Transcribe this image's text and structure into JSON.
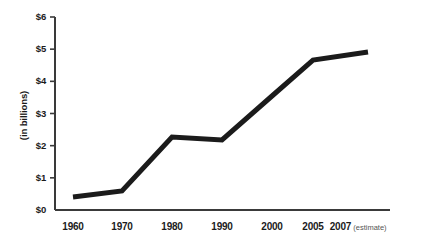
{
  "chart_data": {
    "type": "line",
    "title": "",
    "subtitle": "",
    "xlabel": "",
    "ylabel": "(in billions)",
    "ylim": [
      0,
      6
    ],
    "y_ticks": [
      0,
      1,
      2,
      3,
      4,
      5,
      6
    ],
    "y_tick_labels": [
      "$0",
      "$1",
      "$2",
      "$3",
      "$4",
      "$5",
      "$6"
    ],
    "categories": [
      "1960",
      "1970",
      "1980",
      "1990",
      "2000",
      "2005",
      "2007"
    ],
    "x_tick_labels": [
      "1960",
      "1970",
      "1980",
      "1990",
      "2000",
      "2005",
      "2007"
    ],
    "values": [
      0.5,
      0.8,
      2.3,
      2.25,
      3.55,
      4.65,
      4.9
    ],
    "annotations": [
      {
        "text": "(estimate)",
        "attached_to": "2007"
      }
    ],
    "grid": false,
    "legend": null,
    "series": [
      {
        "name": "value",
        "values": [
          0.5,
          0.8,
          2.3,
          2.25,
          3.55,
          4.65,
          4.9
        ]
      }
    ],
    "vertex_x_values": [
      1960,
      1970,
      1978,
      1990,
      2000,
      2004.5,
      2007
    ],
    "vertex_y_values": [
      0.5,
      0.8,
      2.3,
      2.25,
      3.55,
      4.65,
      4.9
    ]
  },
  "style": {
    "line_color": "#1b1b1b",
    "axis_color": "#3a3a3a",
    "background": "#ffffff",
    "text_color": "#1b1b1b",
    "note_color": "#555555",
    "line_width_px": 5
  },
  "geometry": {
    "plot_left": 55,
    "plot_right": 390,
    "plot_top": 17,
    "plot_bottom": 210,
    "x_positions": [
      73,
      122,
      172,
      222,
      272,
      313,
      365
    ],
    "vertex_px": [
      [
        73,
        197
      ],
      [
        122,
        191
      ],
      [
        172,
        137
      ],
      [
        222,
        140
      ],
      [
        272,
        96
      ],
      [
        313,
        60
      ],
      [
        368,
        52
      ]
    ]
  },
  "axis_note": "estimate"
}
